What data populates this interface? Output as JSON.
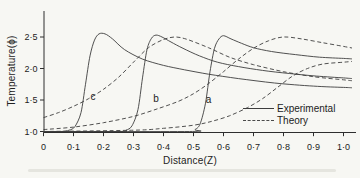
{
  "chart_data": {
    "type": "line",
    "title": "",
    "xlabel": "Distance(Z)",
    "ylabel": "Temperature(ϕ)",
    "xlim": [
      0,
      1.0
    ],
    "ylim": [
      1.0,
      2.9
    ],
    "grid": false,
    "x_ticks": {
      "values": [
        0,
        0.1,
        0.2,
        0.3,
        0.4,
        0.5,
        0.6,
        0.7,
        0.8,
        0.9,
        1.0
      ],
      "labels": [
        "0",
        "0·1",
        "0·2",
        "0·3",
        "0·4",
        "0·5",
        "0·6",
        "0·7",
        "0·8",
        "0·9",
        "1·0"
      ]
    },
    "y_ticks": {
      "values": [
        1.0,
        1.5,
        2.0,
        2.5
      ],
      "labels": [
        "1·0",
        "1·5",
        "2·0",
        "2·5"
      ]
    },
    "legend": {
      "position": "lower right",
      "entries": [
        {
          "label": "Experimental",
          "style": "solid"
        },
        {
          "label": "Theory",
          "style": "dashed"
        }
      ]
    },
    "curve_labels": [
      {
        "text": "c",
        "z": 0.165,
        "t": 1.55
      },
      {
        "text": "b",
        "z": 0.375,
        "t": 1.53
      },
      {
        "text": "a",
        "z": 0.55,
        "t": 1.51
      }
    ],
    "series": [
      {
        "name": "experimental-c",
        "style": "solid",
        "points": [
          [
            0,
            1.0
          ],
          [
            0.06,
            1.0
          ],
          [
            0.085,
            1.02
          ],
          [
            0.105,
            1.08
          ],
          [
            0.125,
            1.3
          ],
          [
            0.14,
            1.75
          ],
          [
            0.155,
            2.2
          ],
          [
            0.17,
            2.45
          ],
          [
            0.185,
            2.55
          ],
          [
            0.205,
            2.55
          ],
          [
            0.23,
            2.47
          ],
          [
            0.27,
            2.3
          ],
          [
            0.33,
            2.15
          ],
          [
            0.4,
            2.05
          ],
          [
            0.47,
            1.98
          ],
          [
            0.55,
            1.91
          ],
          [
            0.65,
            1.84
          ],
          [
            0.77,
            1.77
          ],
          [
            0.9,
            1.72
          ],
          [
            1.0,
            1.7
          ]
        ]
      },
      {
        "name": "experimental-b",
        "style": "solid",
        "points": [
          [
            0,
            1.0
          ],
          [
            0.255,
            1.0
          ],
          [
            0.275,
            1.02
          ],
          [
            0.295,
            1.09
          ],
          [
            0.315,
            1.35
          ],
          [
            0.33,
            1.85
          ],
          [
            0.345,
            2.3
          ],
          [
            0.36,
            2.48
          ],
          [
            0.375,
            2.53
          ],
          [
            0.395,
            2.5
          ],
          [
            0.425,
            2.42
          ],
          [
            0.465,
            2.32
          ],
          [
            0.52,
            2.2
          ],
          [
            0.58,
            2.1
          ],
          [
            0.65,
            2.03
          ],
          [
            0.73,
            1.97
          ],
          [
            0.82,
            1.92
          ],
          [
            0.91,
            1.88
          ],
          [
            1.0,
            1.85
          ]
        ]
      },
      {
        "name": "experimental-a",
        "style": "solid",
        "points": [
          [
            0,
            1.0
          ],
          [
            0.487,
            1.0
          ],
          [
            0.505,
            1.03
          ],
          [
            0.522,
            1.12
          ],
          [
            0.54,
            1.45
          ],
          [
            0.555,
            1.95
          ],
          [
            0.57,
            2.32
          ],
          [
            0.585,
            2.47
          ],
          [
            0.6,
            2.52
          ],
          [
            0.625,
            2.47
          ],
          [
            0.66,
            2.4
          ],
          [
            0.7,
            2.33
          ],
          [
            0.76,
            2.27
          ],
          [
            0.84,
            2.22
          ],
          [
            0.92,
            2.18
          ],
          [
            1.0,
            2.16
          ]
        ]
      },
      {
        "name": "theory-c",
        "style": "dashed",
        "points": [
          [
            0,
            1.22
          ],
          [
            0.05,
            1.3
          ],
          [
            0.1,
            1.4
          ],
          [
            0.15,
            1.52
          ],
          [
            0.2,
            1.67
          ],
          [
            0.25,
            1.86
          ],
          [
            0.3,
            2.1
          ],
          [
            0.35,
            2.33
          ],
          [
            0.4,
            2.46
          ],
          [
            0.44,
            2.5
          ],
          [
            0.48,
            2.46
          ],
          [
            0.55,
            2.33
          ],
          [
            0.62,
            2.18
          ],
          [
            0.7,
            2.06
          ],
          [
            0.8,
            1.95
          ],
          [
            0.9,
            1.87
          ],
          [
            1.0,
            1.82
          ]
        ]
      },
      {
        "name": "theory-b",
        "style": "dashed",
        "points": [
          [
            0,
            1.03
          ],
          [
            0.1,
            1.07
          ],
          [
            0.2,
            1.14
          ],
          [
            0.3,
            1.24
          ],
          [
            0.38,
            1.36
          ],
          [
            0.45,
            1.48
          ],
          [
            0.5,
            1.6
          ],
          [
            0.55,
            1.76
          ],
          [
            0.6,
            1.95
          ],
          [
            0.65,
            2.15
          ],
          [
            0.7,
            2.32
          ],
          [
            0.75,
            2.44
          ],
          [
            0.8,
            2.5
          ],
          [
            0.86,
            2.47
          ],
          [
            0.93,
            2.41
          ],
          [
            1.0,
            2.35
          ]
        ]
      },
      {
        "name": "theory-a",
        "style": "dashed",
        "points": [
          [
            0,
            1.0
          ],
          [
            0.3,
            1.02
          ],
          [
            0.4,
            1.05
          ],
          [
            0.5,
            1.1
          ],
          [
            0.56,
            1.16
          ],
          [
            0.62,
            1.25
          ],
          [
            0.68,
            1.38
          ],
          [
            0.73,
            1.52
          ],
          [
            0.78,
            1.7
          ],
          [
            0.83,
            1.88
          ],
          [
            0.88,
            2.0
          ],
          [
            0.93,
            2.07
          ],
          [
            1.0,
            2.1
          ]
        ]
      }
    ]
  }
}
